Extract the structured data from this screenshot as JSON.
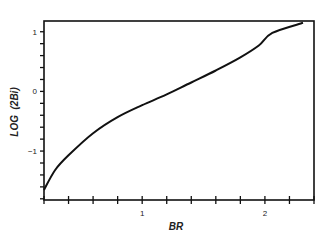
{
  "chart_data": {
    "type": "line",
    "title": "",
    "xlabel": "BR",
    "ylabel": "LOG  (2Bi)",
    "xlim": [
      0.2,
      2.4
    ],
    "ylim": [
      -1.82,
      1.18
    ],
    "grid": false,
    "legend": null,
    "x_ticks_major": [
      {
        "value": 1,
        "label": "1"
      },
      {
        "value": 2,
        "label": "2"
      }
    ],
    "x_ticks_minor_step": 0.2,
    "y_ticks_major": [
      {
        "value": 1,
        "label": "1"
      },
      {
        "value": 0,
        "label": "0"
      },
      {
        "value": -1,
        "label": "−1"
      }
    ],
    "y_ticks_minor_step": 0.2,
    "series": [
      {
        "name": "LOG(2Bi) vs BR",
        "x": [
          0.2,
          0.29,
          0.4,
          0.6,
          0.8,
          1.0,
          1.2,
          1.4,
          1.6,
          1.8,
          1.95,
          2.06,
          2.31
        ],
        "y": [
          -1.65,
          -1.32,
          -1.07,
          -0.7,
          -0.43,
          -0.23,
          -0.05,
          0.15,
          0.35,
          0.57,
          0.77,
          0.98,
          1.15
        ]
      }
    ]
  }
}
